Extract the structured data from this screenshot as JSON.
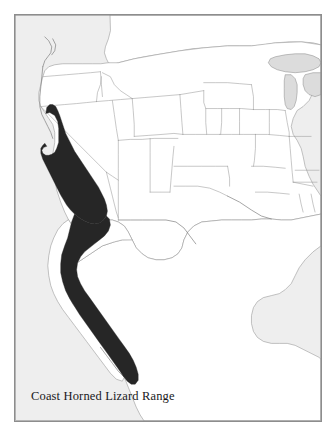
{
  "figure": {
    "caption": "Coast Horned Lizard Range",
    "title": "Coast Horned Lizard Range",
    "frame_border_color": "#8d8d8d",
    "page_background": "#ffffff"
  },
  "map": {
    "type": "range-distribution-map",
    "region": "Western North America",
    "projection_note": "conic",
    "layers": {
      "ocean": {
        "label": "Ocean",
        "color": "#eeeeee"
      },
      "land": {
        "label": "Land",
        "color": "#ffffff"
      },
      "lakes": {
        "label": "Great Lakes",
        "color": "#dcdcdc"
      },
      "borders": {
        "label": "State and national boundaries",
        "color": "#9a9a9a"
      },
      "coastline": {
        "label": "Coastline",
        "color": "#8a8a8a"
      },
      "range": {
        "label": "Coast Horned Lizard Range",
        "color": "#262626"
      }
    },
    "range_areas": [
      {
        "name": "California range",
        "description": "Coastal and interior California from near the Oregon border south through the Transverse and Peninsular ranges"
      },
      {
        "name": "Baja California range",
        "description": "Continuous band down the Baja California peninsula to its southern tip"
      }
    ]
  }
}
